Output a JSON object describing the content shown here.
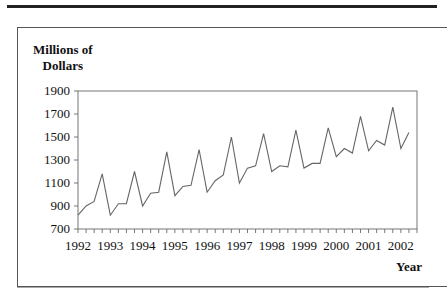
{
  "chart_data": {
    "type": "line",
    "title": "",
    "ylabel": "Millions of Dollars",
    "xlabel": "Year",
    "ylim": [
      700,
      1900
    ],
    "yticks": [
      700,
      900,
      1100,
      1300,
      1500,
      1700,
      1900
    ],
    "xticks": [
      "1992",
      "1993",
      "1994",
      "1995",
      "1996",
      "1997",
      "1998",
      "1999",
      "2000",
      "2001",
      "2002"
    ],
    "grid": false,
    "frequency": "quarterly",
    "x": [
      "1992Q1",
      "1992Q2",
      "1992Q3",
      "1992Q4",
      "1993Q1",
      "1993Q2",
      "1993Q3",
      "1993Q4",
      "1994Q1",
      "1994Q2",
      "1994Q3",
      "1994Q4",
      "1995Q1",
      "1995Q2",
      "1995Q3",
      "1995Q4",
      "1996Q1",
      "1996Q2",
      "1996Q3",
      "1996Q4",
      "1997Q1",
      "1997Q2",
      "1997Q3",
      "1997Q4",
      "1998Q1",
      "1998Q2",
      "1998Q3",
      "1998Q4",
      "1999Q1",
      "1999Q2",
      "1999Q3",
      "1999Q4",
      "2000Q1",
      "2000Q2",
      "2000Q3",
      "2000Q4",
      "2001Q1",
      "2001Q2",
      "2001Q3",
      "2001Q4",
      "2002Q1",
      "2002Q2"
    ],
    "series": [
      {
        "name": "Sales",
        "values": [
          820,
          900,
          940,
          1180,
          820,
          920,
          920,
          1200,
          900,
          1010,
          1020,
          1370,
          990,
          1070,
          1080,
          1390,
          1020,
          1120,
          1170,
          1500,
          1100,
          1230,
          1250,
          1530,
          1200,
          1250,
          1240,
          1560,
          1230,
          1270,
          1270,
          1580,
          1330,
          1400,
          1360,
          1680,
          1380,
          1470,
          1430,
          1760,
          1400,
          1540
        ]
      }
    ]
  },
  "labels": {
    "y_line1": "Millions of",
    "y_line2": "Dollars",
    "x_axis": "Year",
    "yticks": [
      "1900",
      "1700",
      "1500",
      "1300",
      "1100",
      "900",
      "700"
    ],
    "xticks": [
      "1992",
      "1993",
      "1994",
      "1995",
      "1996",
      "1997",
      "1998",
      "1999",
      "2000",
      "2001",
      "2002"
    ]
  }
}
